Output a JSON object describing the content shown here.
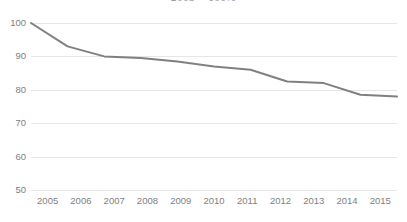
{
  "chart_data": {
    "type": "line",
    "title": "2005 = 100%",
    "xlabel": "",
    "ylabel": "",
    "categories": [
      "2005",
      "2006",
      "2007",
      "2008",
      "2009",
      "2010",
      "2011",
      "2012",
      "2013",
      "2014",
      "2015"
    ],
    "values": [
      100,
      93,
      90,
      89.5,
      88.5,
      87,
      86,
      82.5,
      82,
      78.5,
      78
    ],
    "series": [
      {
        "name": "Index",
        "values": [
          100,
          93,
          90,
          89.5,
          88.5,
          87,
          86,
          82.5,
          82,
          78.5,
          78
        ]
      }
    ],
    "ylim": [
      50,
      100
    ],
    "yticks": [
      100,
      90,
      80,
      70,
      60,
      50
    ],
    "ytick_labels": [
      "100",
      "90",
      "80",
      "70",
      "60",
      "50"
    ],
    "grid": true,
    "legend": false,
    "legend_position": "none",
    "line_color": "#808080",
    "gridline_color": "#e6e6e6",
    "label_color": "#808080",
    "background_color": "#ffffff"
  }
}
